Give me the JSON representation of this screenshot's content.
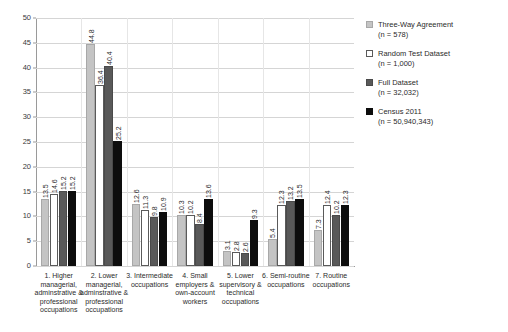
{
  "chart_data": {
    "type": "bar",
    "title": "",
    "subtitle": "",
    "xlabel": "",
    "ylabel": "",
    "ylim": [
      0,
      50
    ],
    "ytick_step": 5,
    "yticks": [
      0,
      5,
      10,
      15,
      20,
      25,
      30,
      35,
      40,
      45,
      50
    ],
    "grid": true,
    "legend_position": "right",
    "categories": [
      "1. Higher managerial, adminstrative & professional occupations",
      "2. Lower managerial, adminstrative & professional occupations",
      "3. Intermediate occupations",
      "4. Small employers & own-account workers",
      "5. Lower supervisory & technical occupations",
      "6. Semi-routine occupations",
      "7. Routine occupations"
    ],
    "series": [
      {
        "name": "Three-Way Agreement",
        "n_label": "(n = 578)",
        "color": "#c4c4c4",
        "values": [
          13.5,
          44.8,
          12.6,
          10.3,
          3.1,
          5.4,
          7.3
        ]
      },
      {
        "name": "Random Test Dataset",
        "n_label": "(n = 1,000)",
        "color": "#ffffff",
        "values": [
          14.6,
          36.4,
          11.3,
          10.2,
          2.8,
          12.3,
          12.4
        ]
      },
      {
        "name": "Full Dataset",
        "n_label": "(n = 32,032)",
        "color": "#595959",
        "values": [
          15.2,
          40.4,
          9.8,
          8.4,
          2.6,
          13.2,
          10.2
        ]
      },
      {
        "name": "Census 2011",
        "n_label": "(n = 50,940,343)",
        "color": "#0d0d0d",
        "values": [
          15.2,
          25.2,
          10.9,
          13.6,
          9.3,
          13.5,
          12.3
        ]
      }
    ]
  },
  "legend": {
    "items": [
      {
        "label": "Three-Way Agreement",
        "n": "(n = 578)"
      },
      {
        "label": "Random Test Dataset",
        "n": "(n = 1,000)"
      },
      {
        "label": "Full Dataset",
        "n": "(n = 32,032)"
      },
      {
        "label": "Census 2011",
        "n": "(n = 50,940,343)"
      }
    ]
  }
}
